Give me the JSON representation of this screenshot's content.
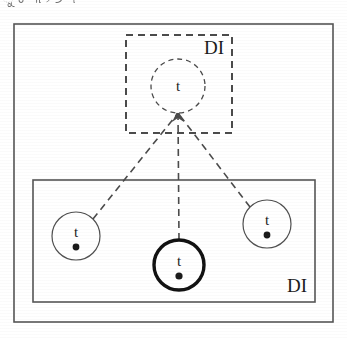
{
  "figure": {
    "title_fragment": "ୁ ଚ ୩ ୨ ୬ ୴ ୋ",
    "outer_frame": {
      "name": "outer-frame",
      "style": "solid",
      "stroke": "#555555",
      "x": 14,
      "y": 24,
      "width": 319,
      "height": 298
    },
    "top_group": {
      "name": "top-dashed-group",
      "label": "DI",
      "label_x": 214,
      "label_y": 54,
      "style": "dashed",
      "stroke": "#4a4a4a",
      "x": 126,
      "y": 35,
      "width": 106,
      "height": 98
    },
    "bottom_group": {
      "name": "bottom-solid-group",
      "label": "DI",
      "label_x": 297,
      "label_y": 292,
      "style": "solid",
      "stroke": "#555555",
      "x": 33,
      "y": 180,
      "width": 282,
      "height": 122
    },
    "apex": {
      "x": 178,
      "y": 113
    },
    "nodes": [
      {
        "name": "node-abstract-t",
        "label": "t",
        "cx": 178,
        "cy": 86,
        "r": 27,
        "style": "dashed",
        "stroke": "#4a4a4a",
        "stroke_width": 1.3,
        "has_dot": false,
        "group": "top"
      },
      {
        "name": "node-left-t",
        "label": "t",
        "cx": 76,
        "cy": 236,
        "r": 24,
        "style": "solid",
        "stroke": "#4f4f4f",
        "stroke_width": 1.2,
        "has_dot": true,
        "dot_r": 3.4,
        "group": "bottom"
      },
      {
        "name": "node-center-t",
        "label": "t",
        "cx": 179,
        "cy": 265,
        "r": 25,
        "style": "solid",
        "stroke": "#111111",
        "stroke_width": 3.4,
        "has_dot": true,
        "dot_r": 3.6,
        "group": "bottom"
      },
      {
        "name": "node-right-t",
        "label": "t",
        "cx": 267,
        "cy": 224,
        "r": 24,
        "style": "solid",
        "stroke": "#4f4f4f",
        "stroke_width": 1.2,
        "has_dot": true,
        "dot_r": 3.4,
        "group": "bottom"
      }
    ],
    "edges": [
      {
        "name": "edge-left-to-apex",
        "x1": 93,
        "y1": 219,
        "x2": 178,
        "y2": 113
      },
      {
        "name": "edge-center-to-apex",
        "x1": 179,
        "y1": 240,
        "x2": 178,
        "y2": 113
      },
      {
        "name": "edge-right-to-apex",
        "x1": 250,
        "y1": 207,
        "x2": 178,
        "y2": 113
      }
    ],
    "arrowhead": {
      "name": "apex-arrowhead",
      "x": 178,
      "y": 113,
      "points": "178,110 172,122 178,118 184,122"
    },
    "colors": {
      "background": "#ffffff",
      "ink": "#1a1a1a",
      "thin_stroke": "#4f4f4f",
      "bold_stroke": "#111111",
      "dashed_stroke": "#4a4a4a"
    },
    "typography": {
      "node_label_size": 15,
      "group_label_size": 19
    }
  }
}
